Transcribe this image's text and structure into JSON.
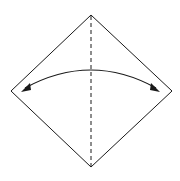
{
  "diagram": {
    "type": "origami-fold-step",
    "colors": {
      "line": "#1a1a1a",
      "background": "#ffffff"
    },
    "square": {
      "top": [
        91,
        15
      ],
      "right": [
        172,
        91
      ],
      "bottom": [
        91,
        167
      ],
      "left": [
        11,
        91
      ]
    },
    "fold_line": {
      "style": "dashed",
      "from": [
        91,
        15
      ],
      "to": [
        91,
        167
      ]
    },
    "arrow": {
      "style": "double-headed-arc",
      "from": [
        22,
        90
      ],
      "to": [
        159,
        90
      ],
      "apex": [
        91,
        68
      ]
    }
  }
}
